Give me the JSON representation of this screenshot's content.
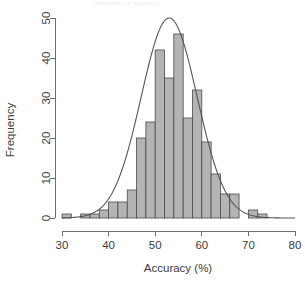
{
  "figure": {
    "faint_title_fragment": "Histogram of accuracy",
    "background_color": "#ffffff",
    "bar_fill_color": "#b4b4b4",
    "bar_border_color": "#4a4a4a",
    "curve_color": "#555555",
    "axis_color": "#6e6e6e"
  },
  "chart_data": {
    "type": "bar",
    "title": "",
    "xlabel": "Accuracy (%)",
    "ylabel": "Frequency",
    "xlim": [
      30,
      80
    ],
    "ylim": [
      0,
      50
    ],
    "xticks": [
      30,
      40,
      50,
      60,
      70,
      80
    ],
    "xtick_labels": [
      "30",
      "40",
      "50",
      "60",
      "70",
      "80"
    ],
    "yticks": [
      0,
      10,
      20,
      30,
      40,
      50
    ],
    "ytick_labels": [
      "0",
      "10",
      "20",
      "30",
      "40",
      "50"
    ],
    "grid": false,
    "legend": false,
    "bin_width": 2,
    "bin_edges": [
      30,
      32,
      34,
      36,
      38,
      40,
      42,
      44,
      46,
      48,
      50,
      52,
      54,
      56,
      58,
      60,
      62,
      64,
      66,
      68,
      70,
      72,
      74
    ],
    "bin_centers": [
      31,
      33,
      35,
      37,
      39,
      41,
      43,
      45,
      47,
      49,
      51,
      53,
      55,
      57,
      59,
      61,
      63,
      65,
      67,
      69,
      71,
      73
    ],
    "categories": [
      "30-32",
      "32-34",
      "34-36",
      "36-38",
      "38-40",
      "40-42",
      "42-44",
      "44-46",
      "46-48",
      "48-50",
      "50-52",
      "52-54",
      "54-56",
      "56-58",
      "58-60",
      "60-62",
      "62-64",
      "64-66",
      "66-68",
      "68-70",
      "70-72",
      "72-74"
    ],
    "values": [
      1,
      0,
      1,
      1,
      2,
      4,
      4,
      7,
      20,
      24,
      42,
      35,
      46,
      25,
      32,
      19,
      11,
      6,
      6,
      0,
      2,
      1
    ],
    "overlay": {
      "type": "line",
      "name": "normal density curve",
      "peak_x": 53,
      "peak_y": 50,
      "mean": 53,
      "sigma": 6.0,
      "amplitude": 50
    },
    "annotations": []
  }
}
